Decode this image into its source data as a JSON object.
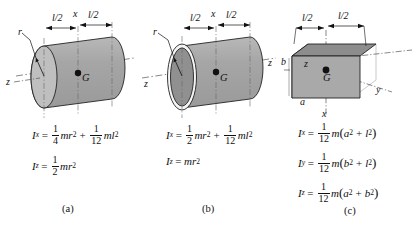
{
  "figure": {
    "background": "#ffffff",
    "ink": "#111111",
    "panels": [
      {
        "id": "a",
        "caption": "(a)",
        "body": "solid-cylinder",
        "labels": {
          "radius": "r",
          "axis_z": "z",
          "axis_x": "x",
          "center": "G",
          "half_length_left": "l/2",
          "half_length_right": "l/2"
        },
        "equations": [
          {
            "lhs": "I",
            "lhs_sub": "x",
            "terms": [
              {
                "num": "1",
                "den": "4",
                "body": "mr",
                "exp": "2"
              },
              {
                "op": "+",
                "num": "1",
                "den": "12",
                "body": "ml",
                "exp": "2"
              }
            ]
          },
          {
            "lhs": "I",
            "lhs_sub": "z",
            "terms": [
              {
                "num": "1",
                "den": "2",
                "body": "mr",
                "exp": "2"
              }
            ]
          }
        ]
      },
      {
        "id": "b",
        "caption": "(b)",
        "body": "thin-tube",
        "labels": {
          "radius": "r",
          "axis_z_left": "z",
          "axis_z_right": "z",
          "axis_x": "x",
          "center": "G",
          "half_length_left": "l/2",
          "half_length_right": "l/2"
        },
        "equations": [
          {
            "lhs": "I",
            "lhs_sub": "x",
            "terms": [
              {
                "num": "1",
                "den": "2",
                "body": "mr",
                "exp": "2"
              },
              {
                "op": "+",
                "num": "1",
                "den": "12",
                "body": "ml",
                "exp": "2"
              }
            ]
          },
          {
            "lhs": "I",
            "lhs_sub": "z",
            "terms": [
              {
                "body": "mr",
                "exp": "2"
              }
            ]
          }
        ]
      },
      {
        "id": "c",
        "caption": "(c)",
        "body": "rectangular-block",
        "labels": {
          "height_b": "b",
          "depth_a": "a",
          "axis_z": "z",
          "axis_y": "y",
          "axis_x": "x",
          "center": "G",
          "half_length_left": "l/2",
          "half_length_right": "l/2"
        },
        "equations": [
          {
            "lhs": "I",
            "lhs_sub": "x",
            "terms": [
              {
                "num": "1",
                "den": "12",
                "body": "m",
                "group": [
                  "a",
                  "2",
                  "+",
                  "l",
                  "2"
                ]
              }
            ]
          },
          {
            "lhs": "I",
            "lhs_sub": "y",
            "terms": [
              {
                "num": "1",
                "den": "12",
                "body": "m",
                "group": [
                  "b",
                  "2",
                  "+",
                  "l",
                  "2"
                ]
              }
            ]
          },
          {
            "lhs": "I",
            "lhs_sub": "z",
            "terms": [
              {
                "num": "1",
                "den": "12",
                "body": "m",
                "group": [
                  "a",
                  "2",
                  "+",
                  "b",
                  "2"
                ]
              }
            ]
          }
        ]
      }
    ]
  },
  "colors": {
    "cylinder_body": "#a9a9a9",
    "cylinder_face": "#bdbdbd",
    "tube_face_inner": "#8f8f8f",
    "tube_rim": "#f2f2f2",
    "block_top": "#8e8e8e",
    "block_front": "#a9a9a9",
    "block_side": "#c4c4c4",
    "outline": "#222222",
    "axis": "#444444"
  },
  "panel_a": {
    "eq1": {
      "lhs": "I",
      "sub": "x",
      "eq": "=",
      "f1num": "1",
      "f1den": "4",
      "t1": "mr",
      "t1exp": "2",
      "plus": "+",
      "f2num": "1",
      "f2den": "12",
      "t2": "ml",
      "t2exp": "2"
    },
    "eq2": {
      "lhs": "I",
      "sub": "z",
      "eq": "=",
      "f1num": "1",
      "f1den": "2",
      "t1": "mr",
      "t1exp": "2"
    },
    "caption": "(a)",
    "dim_left": "l/2",
    "dim_right": "l/2",
    "r": "r",
    "z": "z",
    "x": "x",
    "G": "G"
  },
  "panel_b": {
    "eq1": {
      "lhs": "I",
      "sub": "x",
      "eq": "=",
      "f1num": "1",
      "f1den": "2",
      "t1": "mr",
      "t1exp": "2",
      "plus": "+",
      "f2num": "1",
      "f2den": "12",
      "t2": "ml",
      "t2exp": "2"
    },
    "eq2": {
      "lhs": "I",
      "sub": "z",
      "eq": "=",
      "t1": "mr",
      "t1exp": "2"
    },
    "caption": "(b)",
    "dim_left": "l/2",
    "dim_right": "l/2",
    "r": "r",
    "z_left": "z",
    "z_right": "z",
    "x": "x",
    "G": "G"
  },
  "panel_c": {
    "eq1": {
      "lhs": "I",
      "sub": "x",
      "eq": "=",
      "f1num": "1",
      "f1den": "12",
      "m": "m",
      "open": "(",
      "v1": "a",
      "v1exp": "2",
      "plus": "+",
      "v2": "l",
      "v2exp": "2",
      "close": ")"
    },
    "eq2": {
      "lhs": "I",
      "sub": "y",
      "eq": "=",
      "f1num": "1",
      "f1den": "12",
      "m": "m",
      "open": "(",
      "v1": "b",
      "v1exp": "2",
      "plus": "+",
      "v2": "l",
      "v2exp": "2",
      "close": ")"
    },
    "eq3": {
      "lhs": "I",
      "sub": "z",
      "eq": "=",
      "f1num": "1",
      "f1den": "12",
      "m": "m",
      "open": "(",
      "v1": "a",
      "v1exp": "2",
      "plus": "+",
      "v2": "b",
      "v2exp": "2",
      "close": ")"
    },
    "caption": "(c)",
    "dim_left": "l/2",
    "dim_right": "l/2",
    "b": "b",
    "a": "a",
    "z": "z",
    "y": "y",
    "x": "x",
    "G": "G"
  }
}
